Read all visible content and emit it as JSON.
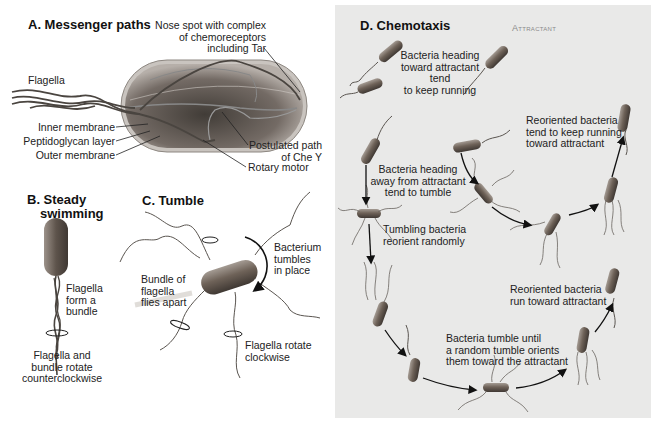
{
  "panels": {
    "a": {
      "title": "A. Messenger paths",
      "labels": {
        "nose_spot": [
          "Nose spot with complex",
          "of chemoreceptors",
          "including Tar"
        ],
        "flagella": "Flagella",
        "inner_membrane": "Inner membrane",
        "peptidoglycan": "Peptidoglycan layer",
        "outer_membrane": "Outer membrane",
        "chey_path": [
          "Postulated path",
          "of Che Y"
        ],
        "rotary_motor": "Rotary motor"
      }
    },
    "b": {
      "title": [
        "B. Steady",
        "swimming"
      ],
      "labels": {
        "bundle": [
          "Flagella",
          "form a",
          "bundle"
        ],
        "rotation": [
          "Flagella and",
          "bundle rotate",
          "counterclockwise"
        ]
      }
    },
    "c": {
      "title": "C. Tumble",
      "labels": {
        "tumbles": [
          "Bacterium",
          "tumbles",
          "in place"
        ],
        "flies_apart": [
          "Bundle of",
          "flagella",
          "flies apart"
        ],
        "clockwise": [
          "Flagella rotate",
          "clockwise"
        ]
      }
    },
    "d": {
      "title": "D. Chemotaxis",
      "attractant": "Attractant",
      "labels": {
        "toward": [
          "Bacteria heading",
          "toward attractant tend",
          "to keep running"
        ],
        "reoriented_keep": [
          "Reoriented bacteria",
          "tend to keep running",
          "toward attractant"
        ],
        "away": [
          "Bacteria heading",
          "away from attractant",
          "tend to tumble"
        ],
        "tumbling": [
          "Tumbling bacteria",
          "reorient randomly"
        ],
        "reoriented_run": [
          "Reoriented bacteria",
          "run toward attractant"
        ],
        "tumble_until": [
          "Bacteria tumble until",
          "a random tumble orients",
          "them toward the attractant"
        ]
      }
    }
  },
  "colors": {
    "panel_d_bg": "#e9e9e8",
    "bacterium_body": "#6e6258",
    "bacterium_dark": "#3f3833",
    "flagella": "#5a5550",
    "attractant_label": "#8a8a8a"
  }
}
